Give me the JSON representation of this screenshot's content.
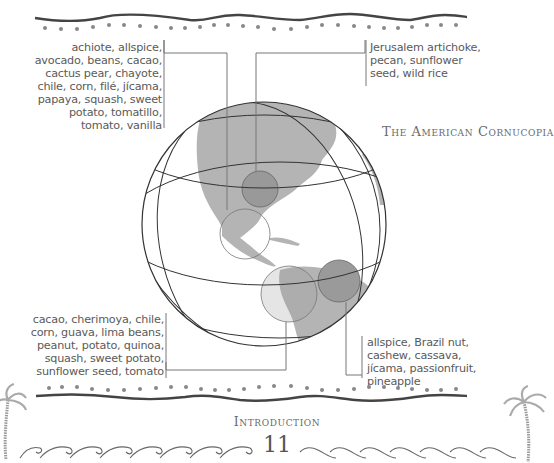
{
  "figure": {
    "title": "The American Cornucopia",
    "callouts": [
      {
        "id": "mexico-central-america",
        "lines": [
          "achiote, allspice,",
          "avocado, beans, cacao,",
          "cactus pear, chayote,",
          "chile, corn, filé, jícama,",
          "papaya, squash, sweet",
          "potato, tomatillo,",
          "tomato, vanilla"
        ]
      },
      {
        "id": "north-america",
        "lines": [
          "Jerusalem artichoke,",
          "pecan, sunflower",
          "seed, wild rice"
        ]
      },
      {
        "id": "andes",
        "lines": [
          "cacao, cherimoya, chile,",
          "corn, guava, lima beans,",
          "peanut, potato, quinoa,",
          "squash, sweet potato,",
          "sunflower seed, tomato"
        ]
      },
      {
        "id": "brazil",
        "lines": [
          "allspice, Brazil nut,",
          "cashew, cassava,",
          "jícama, passionfruit,",
          "pineapple"
        ]
      }
    ]
  },
  "footer": {
    "section": "Introduction",
    "page_number": "11"
  },
  "colors": {
    "text": "#5a5a5a",
    "land": "#b4b4b4",
    "region_highlight": "#9a9a9a",
    "lines": "#333333",
    "dots": "#888888"
  }
}
